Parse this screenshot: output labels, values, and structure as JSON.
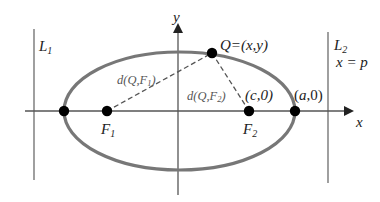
{
  "diagram": {
    "colors": {
      "ellipse": "#777777",
      "axis": "#555555",
      "directrix": "#888888",
      "point": "#000000",
      "dashed": "#555555",
      "text": "#222222"
    },
    "axes": {
      "x_label": "x",
      "y_label": "y"
    },
    "lines": {
      "left": {
        "label_main": "L",
        "label_sub": "1"
      },
      "right": {
        "label_main": "L",
        "label_sub": "2",
        "equation": "x = p"
      }
    },
    "points": {
      "Q": {
        "label": "Q=(x,y)"
      },
      "F1": {
        "label_main": "F",
        "label_sub": "1"
      },
      "F2": {
        "label_main": "F",
        "label_sub": "2",
        "coord_label": "(c,0)"
      },
      "right_vertex": {
        "label_pre": "(",
        "label_var": "a",
        "label_post": ",0)"
      },
      "left_vertex": {
        "label": ""
      }
    },
    "distances": {
      "QF1": {
        "label_pre": "d(Q,F",
        "label_sub": "1",
        "label_post": ")"
      },
      "QF2": {
        "label_pre": "d(Q,F",
        "label_sub": "2",
        "label_post": ")"
      }
    }
  }
}
